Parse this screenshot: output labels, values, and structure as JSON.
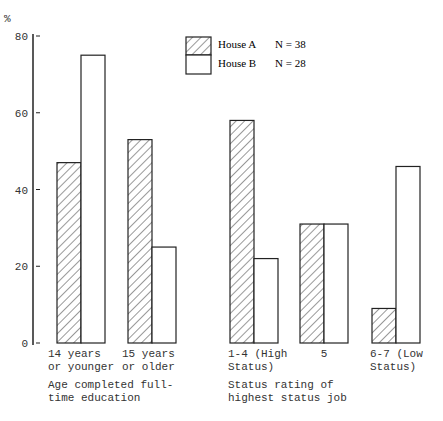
{
  "chart_data": {
    "type": "bar",
    "title": "",
    "ylabel": "%",
    "ylim": [
      0,
      80
    ],
    "yticks": [
      0,
      20,
      40,
      60,
      80
    ],
    "grid": false,
    "legend_position": "top-center",
    "groups": [
      {
        "label": "Age completed full-time education",
        "label_lines": [
          "Age completed full-",
          "time education"
        ],
        "categories": [
          {
            "label_lines": [
              "14 years",
              "or younger"
            ]
          },
          {
            "label_lines": [
              "15 years",
              "or older"
            ]
          }
        ]
      },
      {
        "label": "Status rating of highest status job",
        "label_lines": [
          "Status rating of",
          "highest status job"
        ],
        "categories": [
          {
            "label_lines": [
              "1-4 (High",
              "Status)"
            ]
          },
          {
            "label_lines": [
              "5"
            ]
          },
          {
            "label_lines": [
              "6-7 (Low",
              "Status)"
            ]
          }
        ]
      }
    ],
    "categories": [
      "14 years or younger",
      "15 years or older",
      "1-4 (High Status)",
      "5",
      "6-7 (Low Status)"
    ],
    "series": [
      {
        "name": "House A",
        "n_label": "N = 38",
        "pattern": "hatched",
        "values": [
          47,
          53,
          58,
          31,
          9
        ]
      },
      {
        "name": "House B",
        "n_label": "N = 28",
        "pattern": "plain",
        "values": [
          75,
          25,
          22,
          31,
          46
        ]
      }
    ]
  }
}
